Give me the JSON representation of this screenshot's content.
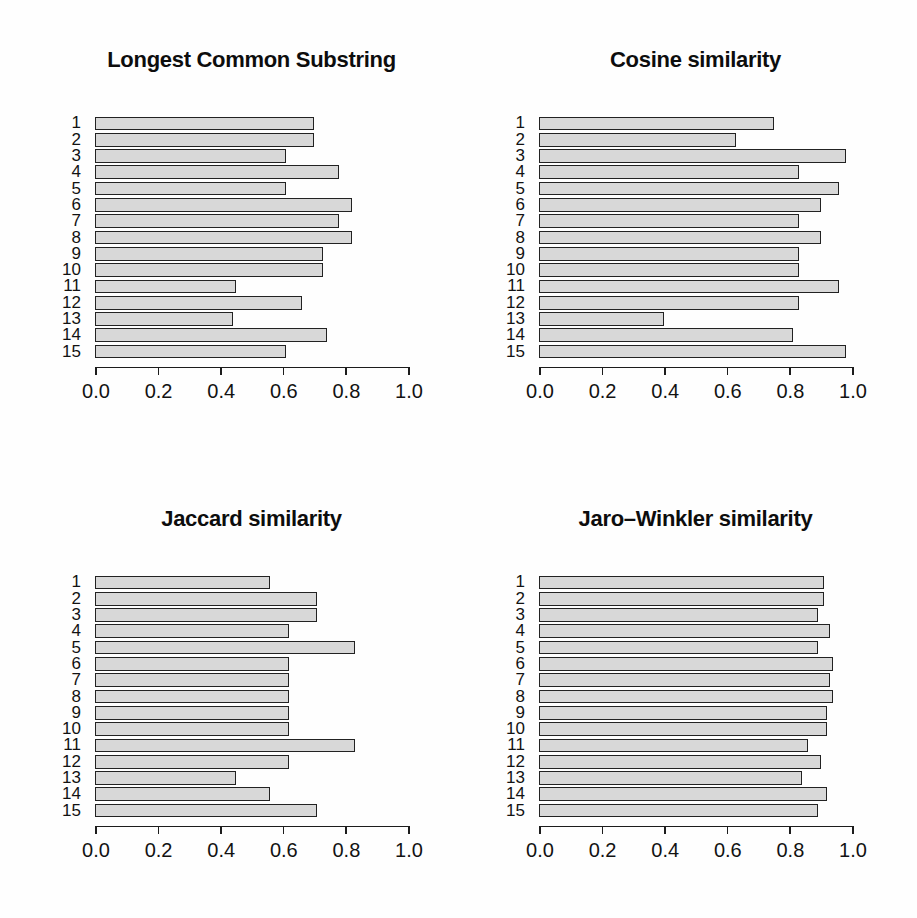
{
  "figure": {
    "background": "#fefefe",
    "text_color": "#121212",
    "layout": "2x2 grid of horizontal bar charts"
  },
  "chart_data": [
    {
      "type": "bar",
      "orientation": "horizontal",
      "title": "Longest Common Substring",
      "categories": [
        "1",
        "2",
        "3",
        "4",
        "5",
        "6",
        "7",
        "8",
        "9",
        "10",
        "11",
        "12",
        "13",
        "14",
        "15"
      ],
      "values": [
        0.7,
        0.7,
        0.61,
        0.78,
        0.61,
        0.82,
        0.78,
        0.82,
        0.73,
        0.73,
        0.45,
        0.66,
        0.44,
        0.74,
        0.61
      ],
      "xlim": [
        0,
        1
      ],
      "x_ticks": [
        "0.0",
        "0.2",
        "0.4",
        "0.6",
        "0.8",
        "1.0"
      ],
      "xlabel": "",
      "ylabel": "",
      "grid": false,
      "legend": false,
      "bar_fill": "#d8d8d8",
      "bar_border": "#222222"
    },
    {
      "type": "bar",
      "orientation": "horizontal",
      "title": "Cosine similarity",
      "categories": [
        "1",
        "2",
        "3",
        "4",
        "5",
        "6",
        "7",
        "8",
        "9",
        "10",
        "11",
        "12",
        "13",
        "14",
        "15"
      ],
      "values": [
        0.75,
        0.63,
        0.98,
        0.83,
        0.96,
        0.9,
        0.83,
        0.9,
        0.83,
        0.83,
        0.96,
        0.83,
        0.4,
        0.81,
        0.98
      ],
      "xlim": [
        0,
        1
      ],
      "x_ticks": [
        "0.0",
        "0.2",
        "0.4",
        "0.6",
        "0.8",
        "1.0"
      ],
      "xlabel": "",
      "ylabel": "",
      "grid": false,
      "legend": false,
      "bar_fill": "#d8d8d8",
      "bar_border": "#222222"
    },
    {
      "type": "bar",
      "orientation": "horizontal",
      "title": "Jaccard similarity",
      "categories": [
        "1",
        "2",
        "3",
        "4",
        "5",
        "6",
        "7",
        "8",
        "9",
        "10",
        "11",
        "12",
        "13",
        "14",
        "15"
      ],
      "values": [
        0.56,
        0.71,
        0.71,
        0.62,
        0.83,
        0.62,
        0.62,
        0.62,
        0.62,
        0.62,
        0.83,
        0.62,
        0.45,
        0.56,
        0.71
      ],
      "xlim": [
        0,
        1
      ],
      "x_ticks": [
        "0.0",
        "0.2",
        "0.4",
        "0.6",
        "0.8",
        "1.0"
      ],
      "xlabel": "",
      "ylabel": "",
      "grid": false,
      "legend": false,
      "bar_fill": "#d8d8d8",
      "bar_border": "#222222"
    },
    {
      "type": "bar",
      "orientation": "horizontal",
      "title": "Jaro–Winkler similarity",
      "categories": [
        "1",
        "2",
        "3",
        "4",
        "5",
        "6",
        "7",
        "8",
        "9",
        "10",
        "11",
        "12",
        "13",
        "14",
        "15"
      ],
      "values": [
        0.91,
        0.91,
        0.89,
        0.93,
        0.89,
        0.94,
        0.93,
        0.94,
        0.92,
        0.92,
        0.86,
        0.9,
        0.84,
        0.92,
        0.89
      ],
      "xlim": [
        0,
        1
      ],
      "x_ticks": [
        "0.0",
        "0.2",
        "0.4",
        "0.6",
        "0.8",
        "1.0"
      ],
      "xlabel": "",
      "ylabel": "",
      "grid": false,
      "legend": false,
      "bar_fill": "#d8d8d8",
      "bar_border": "#222222"
    }
  ]
}
